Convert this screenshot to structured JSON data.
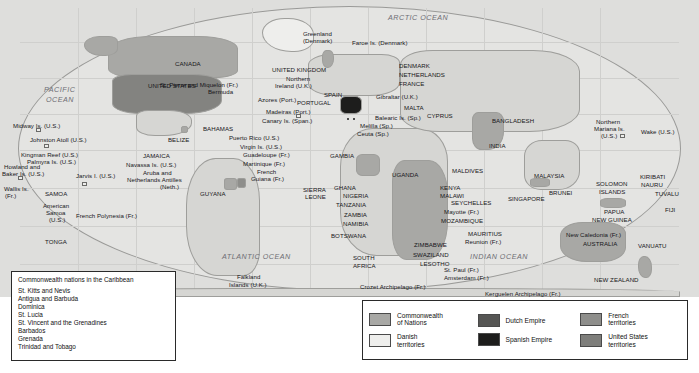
{
  "map": {
    "ocean_labels": [
      {
        "text": "ARCTIC OCEAN",
        "x": 388,
        "y": 14
      },
      {
        "text": "PACIFIC",
        "x": 44,
        "y": 86
      },
      {
        "text": "OCEAN",
        "x": 46,
        "y": 96
      },
      {
        "text": "ATLANTIC OCEAN",
        "x": 222,
        "y": 253
      },
      {
        "text": "INDIAN OCEAN",
        "x": 470,
        "y": 253
      }
    ],
    "labels": [
      {
        "text": "Greenland",
        "x": 303,
        "y": 30
      },
      {
        "text": "(Denmark)",
        "x": 303,
        "y": 37
      },
      {
        "text": "Faroe Is. (Denmark)",
        "x": 352,
        "y": 39
      },
      {
        "text": "CANADA",
        "x": 175,
        "y": 60
      },
      {
        "text": "St. Pierre and Miquelon (Fr.)",
        "x": 160,
        "y": 81
      },
      {
        "text": "UNITED KINGDOM",
        "x": 272,
        "y": 66
      },
      {
        "text": "Northern",
        "x": 286,
        "y": 75
      },
      {
        "text": "Ireland (U.K.)",
        "x": 275,
        "y": 82
      },
      {
        "text": "DENMARK",
        "x": 399,
        "y": 62
      },
      {
        "text": "NETHERLANDS",
        "x": 399,
        "y": 71
      },
      {
        "text": "FRANCE",
        "x": 399,
        "y": 80
      },
      {
        "text": "UNITED STATES",
        "x": 148,
        "y": 82
      },
      {
        "text": "Bermuda",
        "x": 208,
        "y": 88
      },
      {
        "text": "Azores (Port.)",
        "x": 258,
        "y": 96
      },
      {
        "text": "SPAIN",
        "x": 324,
        "y": 91
      },
      {
        "text": "PORTUGAL",
        "x": 297,
        "y": 99
      },
      {
        "text": "Gibraltar (U.K.)",
        "x": 376,
        "y": 93
      },
      {
        "text": "MALTA",
        "x": 404,
        "y": 104
      },
      {
        "text": "CYPRUS",
        "x": 427,
        "y": 112
      },
      {
        "text": "Madeiras (Port.)",
        "x": 266,
        "y": 108
      },
      {
        "text": "Balearic Is. (Sp.)",
        "x": 375,
        "y": 114
      },
      {
        "text": "Canary Is. (Span.)",
        "x": 262,
        "y": 117
      },
      {
        "text": "Melilla (Sp.)",
        "x": 360,
        "y": 122
      },
      {
        "text": "Ceuta (Sp.)",
        "x": 357,
        "y": 130
      },
      {
        "text": "BANGLADESH",
        "x": 492,
        "y": 117
      },
      {
        "text": "INDIA",
        "x": 489,
        "y": 142
      },
      {
        "text": "Northern",
        "x": 596,
        "y": 118
      },
      {
        "text": "Mariana Is.",
        "x": 594,
        "y": 125
      },
      {
        "text": "(U.S.)",
        "x": 601,
        "y": 132
      },
      {
        "text": "Wake (U.S.)",
        "x": 641,
        "y": 128
      },
      {
        "text": "BAHAMAS",
        "x": 203,
        "y": 125
      },
      {
        "text": "Puerto Rico (U.S.)",
        "x": 229,
        "y": 134
      },
      {
        "text": "Virgin Is. (U.S.)",
        "x": 240,
        "y": 143
      },
      {
        "text": "Guadeloupe (Fr.)",
        "x": 243,
        "y": 151
      },
      {
        "text": "Martinique (Fr.)",
        "x": 243,
        "y": 160
      },
      {
        "text": "French",
        "x": 257,
        "y": 168
      },
      {
        "text": "Guiana (Fr.)",
        "x": 251,
        "y": 175
      },
      {
        "text": "BELIZE",
        "x": 168,
        "y": 136
      },
      {
        "text": "JAMAICA",
        "x": 143,
        "y": 152
      },
      {
        "text": "Navassa Is. (U.S.)",
        "x": 126,
        "y": 161
      },
      {
        "text": "Aruba and",
        "x": 143,
        "y": 169
      },
      {
        "text": "Netherlands Antilles",
        "x": 127,
        "y": 176
      },
      {
        "text": "(Neth.)",
        "x": 160,
        "y": 183
      },
      {
        "text": "GUYANA",
        "x": 200,
        "y": 190
      },
      {
        "text": "Midway Is. (U.S.)",
        "x": 13,
        "y": 122
      },
      {
        "text": "Johnston Atoll (U.S.)",
        "x": 30,
        "y": 136
      },
      {
        "text": "Kingman Reef (U.S.)",
        "x": 21,
        "y": 151
      },
      {
        "text": "Palmyra Is. (U.S.)",
        "x": 27,
        "y": 158
      },
      {
        "text": "Howland and",
        "x": 4,
        "y": 163
      },
      {
        "text": "Baker Is. (U.S.)",
        "x": 2,
        "y": 170
      },
      {
        "text": "Jarvis I. (U.S.)",
        "x": 76,
        "y": 172
      },
      {
        "text": "Wallis Is.",
        "x": 4,
        "y": 185
      },
      {
        "text": "(Fr.)",
        "x": 5,
        "y": 192
      },
      {
        "text": "SAMOA",
        "x": 45,
        "y": 190
      },
      {
        "text": "American",
        "x": 43,
        "y": 202
      },
      {
        "text": "Samoa",
        "x": 46,
        "y": 209
      },
      {
        "text": "(U.S.)",
        "x": 49,
        "y": 216
      },
      {
        "text": "French Polynesia (Fr.)",
        "x": 76,
        "y": 212
      },
      {
        "text": "TONGA",
        "x": 45,
        "y": 238
      },
      {
        "text": "GAMBIA",
        "x": 330,
        "y": 152
      },
      {
        "text": "UGANDA",
        "x": 392,
        "y": 171
      },
      {
        "text": "SIERRA",
        "x": 303,
        "y": 186
      },
      {
        "text": "LEONE",
        "x": 305,
        "y": 193
      },
      {
        "text": "GHANA",
        "x": 334,
        "y": 184
      },
      {
        "text": "NIGERIA",
        "x": 343,
        "y": 192
      },
      {
        "text": "TANZANIA",
        "x": 336,
        "y": 201
      },
      {
        "text": "ZAMBIA",
        "x": 344,
        "y": 211
      },
      {
        "text": "NAMIBIA",
        "x": 343,
        "y": 220
      },
      {
        "text": "BOTSWANA",
        "x": 331,
        "y": 232
      },
      {
        "text": "SOUTH",
        "x": 353,
        "y": 254
      },
      {
        "text": "AFRICA",
        "x": 353,
        "y": 262
      },
      {
        "text": "ZIMBABWE",
        "x": 414,
        "y": 241
      },
      {
        "text": "SWAZILAND",
        "x": 413,
        "y": 251
      },
      {
        "text": "LESOTHO",
        "x": 420,
        "y": 260
      },
      {
        "text": "MALDIVES",
        "x": 452,
        "y": 167
      },
      {
        "text": "KENYA",
        "x": 440,
        "y": 184
      },
      {
        "text": "MALAWI",
        "x": 440,
        "y": 192
      },
      {
        "text": "SEYCHELLES",
        "x": 451,
        "y": 199
      },
      {
        "text": "Mayotte (Fr.)",
        "x": 444,
        "y": 208
      },
      {
        "text": "MOZAMBIQUE",
        "x": 441,
        "y": 217
      },
      {
        "text": "MAURITIUS",
        "x": 468,
        "y": 230
      },
      {
        "text": "Reunion (Fr.)",
        "x": 465,
        "y": 238
      },
      {
        "text": "MALAYSIA",
        "x": 534,
        "y": 172
      },
      {
        "text": "SINGAPORE",
        "x": 508,
        "y": 195
      },
      {
        "text": "BRUNEI",
        "x": 549,
        "y": 189
      },
      {
        "text": "SOLOMON",
        "x": 596,
        "y": 180
      },
      {
        "text": "ISLANDS",
        "x": 599,
        "y": 188
      },
      {
        "text": "KIRIBATI",
        "x": 640,
        "y": 173
      },
      {
        "text": "NAURU",
        "x": 641,
        "y": 181
      },
      {
        "text": "TUVALU",
        "x": 655,
        "y": 190
      },
      {
        "text": "FIJI",
        "x": 665,
        "y": 206
      },
      {
        "text": "VANUATU",
        "x": 638,
        "y": 242
      },
      {
        "text": "PAPUA",
        "x": 604,
        "y": 208
      },
      {
        "text": "NEW GUINEA",
        "x": 592,
        "y": 216
      },
      {
        "text": "New Caledonia (Fr.)",
        "x": 566,
        "y": 231
      },
      {
        "text": "AUSTRALIA",
        "x": 583,
        "y": 240
      },
      {
        "text": "NEW ZEALAND",
        "x": 594,
        "y": 276
      },
      {
        "text": "Falkland",
        "x": 237,
        "y": 273
      },
      {
        "text": "Islands (U.K.)",
        "x": 229,
        "y": 281
      },
      {
        "text": "Crozet Archipelago (Fr.)",
        "x": 360,
        "y": 283
      },
      {
        "text": "St. Paul (Fr.)",
        "x": 444,
        "y": 266
      },
      {
        "text": "Amsterdam (Fr.)",
        "x": 444,
        "y": 274
      },
      {
        "text": "Kerguelen Archipelago (Fr.)",
        "x": 485,
        "y": 290
      }
    ]
  },
  "caribbean_legend": {
    "title": "Commonwealth nations in the Caribbean",
    "items": [
      "St. Kitts and Nevis",
      "Antigua and Barbuda",
      "Dominica",
      "St. Lucia",
      "St. Vincent and the Grenadines",
      "Barbados",
      "Grenada",
      "Trinidad and Tobago"
    ]
  },
  "legend": {
    "columns": [
      [
        {
          "label": "Commonwealth\nof Nations",
          "color": "#a8a8a5",
          "name": "commonwealth-of-nations"
        },
        {
          "label": "Danish\nterritories",
          "color": "#eeeeec",
          "name": "danish-territories"
        }
      ],
      [
        {
          "label": "Dutch Empire",
          "color": "#565654",
          "name": "dutch-empire"
        },
        {
          "label": "Spanish Empire",
          "color": "#1d1d1c",
          "name": "spanish-empire"
        }
      ],
      [
        {
          "label": "French\nterritories",
          "color": "#8e8e8b",
          "name": "french-territories"
        },
        {
          "label": "United States\nterritories",
          "color": "#7e7e7b",
          "name": "united-states-territories"
        }
      ]
    ]
  }
}
